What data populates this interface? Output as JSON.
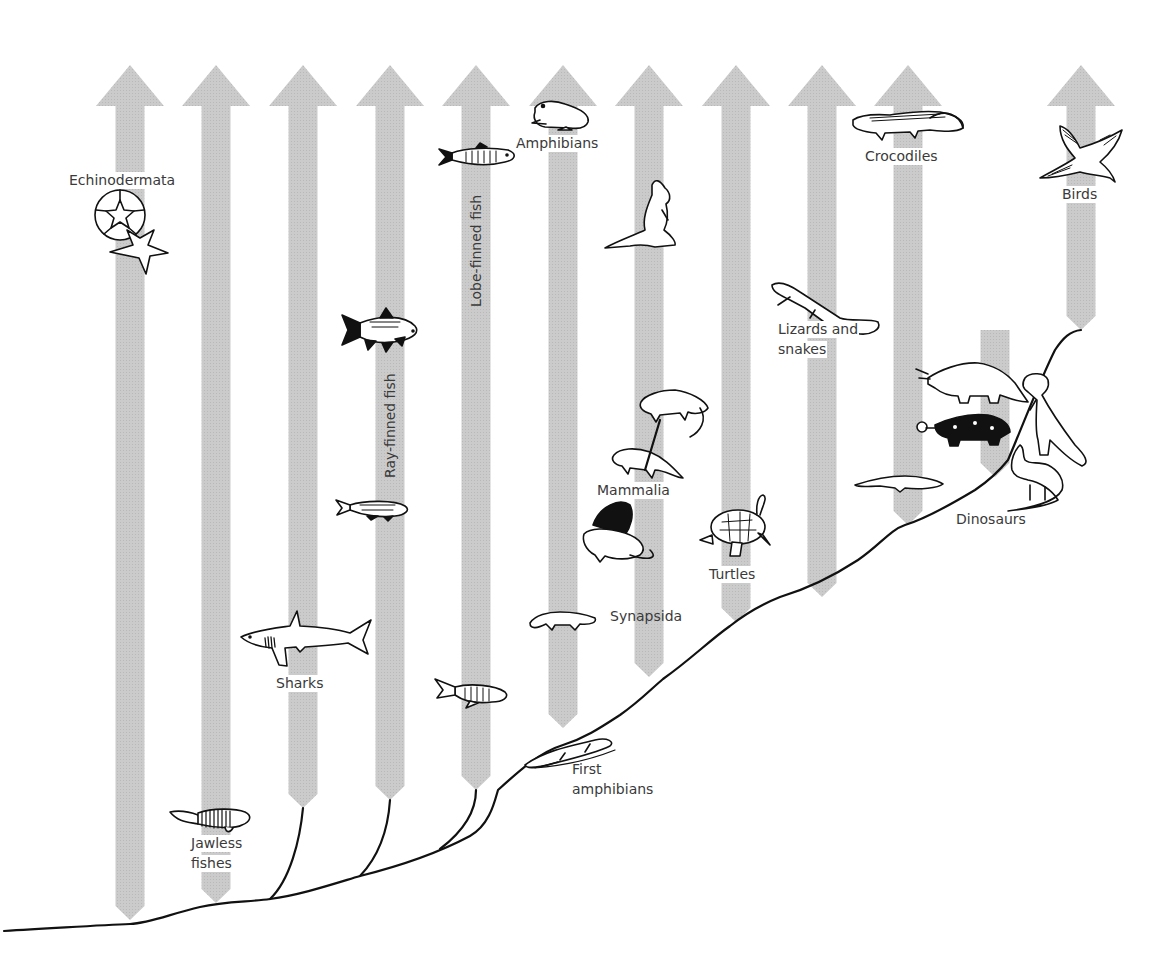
{
  "diagram": {
    "type": "evolutionary-tree",
    "arrow_color": "#c8c8c8",
    "line_color": "#111111",
    "label_color": "#3a3a3a"
  },
  "lineages": [
    {
      "id": "echinodermata",
      "label": "Echinodermata",
      "x": 130,
      "bottom": 920
    },
    {
      "id": "jawless-fishes",
      "label": "Jawless fishes",
      "label_lines": [
        "Jawless",
        "fishes"
      ],
      "x": 216,
      "bottom": 903
    },
    {
      "id": "sharks",
      "label": "Sharks",
      "x": 303,
      "bottom": 808
    },
    {
      "id": "ray-finned-fish",
      "label": "Ray-finned fish",
      "x": 390,
      "bottom": 800
    },
    {
      "id": "lobe-finned-fish",
      "label": "Lobe-finned fish",
      "x": 476,
      "bottom": 790
    },
    {
      "id": "amphibians",
      "label": "Amphibians",
      "x": 563,
      "bottom": 728
    },
    {
      "id": "mammals",
      "label": "Mammalia",
      "x": 649,
      "bottom": 677
    },
    {
      "id": "turtles",
      "label": "Turtles",
      "x": 736,
      "bottom": 622
    },
    {
      "id": "lizards-snakes",
      "label": "Lizards and snakes",
      "label_lines": [
        "Lizards and",
        "snakes"
      ],
      "x": 822,
      "bottom": 597
    },
    {
      "id": "crocodiles",
      "label": "Crocodiles",
      "x": 908,
      "bottom": 525
    },
    {
      "id": "dinosaurs",
      "label": "Dinosaurs",
      "x": 995,
      "top": 330,
      "bottom": 477,
      "extinct": true
    },
    {
      "id": "birds",
      "label": "Birds",
      "x": 1081,
      "bottom": 330
    }
  ],
  "labels": {
    "echinodermata": "Echinodermata",
    "jawless_1": "Jawless",
    "jawless_2": "fishes",
    "sharks": "Sharks",
    "ray_finned": "Ray-finned fish",
    "lobe_finned": "Lobe-finned fish",
    "amphibians": "Amphibians",
    "first_amphibians_1": "First",
    "first_amphibians_2": "amphibians",
    "synapsida": "Synapsida",
    "mammalia": "Mammalia",
    "turtles": "Turtles",
    "lizards_1": "Lizards and",
    "lizards_2": "snakes",
    "crocodiles": "Crocodiles",
    "dinosaurs": "Dinosaurs",
    "birds": "Birds"
  },
  "icons": [
    "sand-dollar-icon",
    "starfish-icon",
    "jawless-fish-icon",
    "shark-icon",
    "ray-finned-fish-icon",
    "early-ray-finned-fish-icon",
    "coelacanth-icon",
    "early-lobe-finned-fish-icon",
    "frog-icon",
    "first-amphibian-icon",
    "synapsid-icon",
    "dimetrodon-icon",
    "therapsid-icon",
    "early-mammal-icon",
    "kangaroo-icon",
    "turtle-icon",
    "lizard-icon",
    "early-archosaur-icon",
    "crocodile-icon",
    "triceratops-icon",
    "ankylosaur-icon",
    "theropod-icon",
    "sauropod-icon",
    "bird-icon"
  ]
}
